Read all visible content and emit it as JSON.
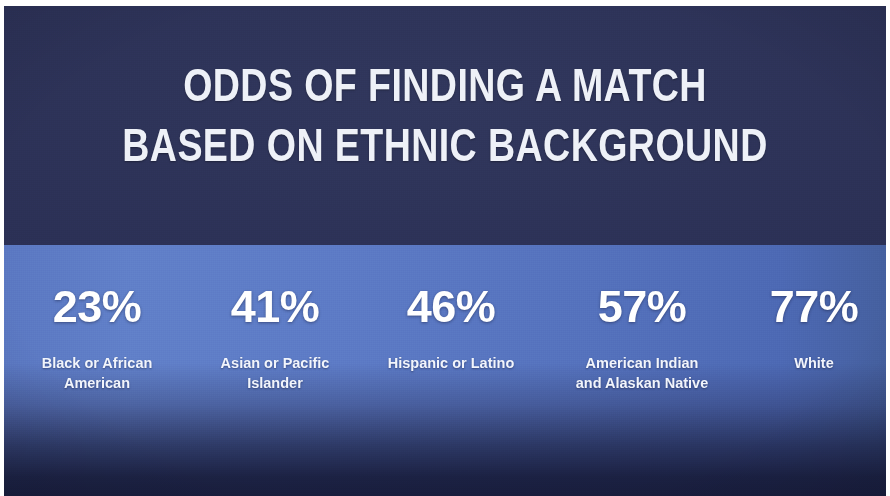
{
  "slide": {
    "title_line_1": "ODDS OF FINDING A MATCH",
    "title_line_2": "BASED ON ETHNIC BACKGROUND"
  },
  "colors": {
    "header_navy": "#2b3055",
    "band_blue_left": "#5b78c2",
    "band_blue_right": "#45609f",
    "footer_navy": "#2e3558",
    "text_white": "#ffffff"
  },
  "chart_data": {
    "type": "bar",
    "title": "ODDS OF FINDING A MATCH BASED ON ETHNIC BACKGROUND",
    "xlabel": "Ethnic Background",
    "ylabel": "Odds of Finding a Match (%)",
    "ylim": [
      0,
      100
    ],
    "grid": false,
    "legend": "none",
    "categories": [
      "Black or African American",
      "Asian or Pacific Islander",
      "Hispanic or Latino",
      "American Indian and Alaskan Native",
      "White"
    ],
    "values": [
      23,
      41,
      46,
      57,
      77
    ],
    "value_labels": [
      "23%",
      "41%",
      "46%",
      "57%",
      "77%"
    ]
  },
  "stats": [
    {
      "value": "23%",
      "label": "Black or African\nAmerican"
    },
    {
      "value": "41%",
      "label": "Asian or Pacific\nIslander"
    },
    {
      "value": "46%",
      "label": "Hispanic or Latino"
    },
    {
      "value": "57%",
      "label": "American Indian\nand Alaskan Native"
    },
    {
      "value": "77%",
      "label": "White"
    }
  ]
}
